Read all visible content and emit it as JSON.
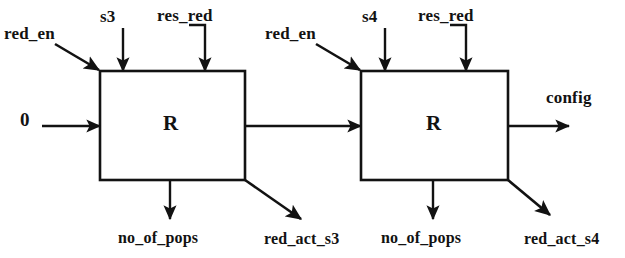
{
  "diagram": {
    "line_color": "#121212",
    "background_color": "#ffffff",
    "blocks": [
      {
        "id": "block-r-1",
        "label": "R",
        "x": 100,
        "y": 71,
        "width": 145,
        "height": 109
      },
      {
        "id": "block-r-2",
        "label": "R",
        "x": 361,
        "y": 71,
        "width": 147,
        "height": 109
      }
    ],
    "labels": {
      "block1": {
        "red_en": "red_en",
        "s3": "s3",
        "res_red": "res_red",
        "input_zero": "0",
        "no_of_pops": "no_of_pops",
        "red_act": "red_act_s3"
      },
      "block2": {
        "red_en": "red_en",
        "s4": "s4",
        "res_red": "res_red",
        "no_of_pops": "no_of_pops",
        "red_act": "red_act_s4",
        "config": "config"
      }
    },
    "signals": [
      {
        "name": "red_en",
        "direction": "in",
        "target": "block-r-1",
        "edge": "top-left-corner",
        "style": "diagonal"
      },
      {
        "name": "s3",
        "direction": "in",
        "target": "block-r-1",
        "edge": "top",
        "style": "vertical"
      },
      {
        "name": "res_red",
        "direction": "in",
        "target": "block-r-1",
        "edge": "top",
        "style": "elbow"
      },
      {
        "name": "0",
        "direction": "in",
        "target": "block-r-1",
        "edge": "left",
        "style": "horizontal"
      },
      {
        "name": "no_of_pops",
        "direction": "out",
        "target": "block-r-1",
        "edge": "bottom",
        "style": "vertical"
      },
      {
        "name": "red_act_s3",
        "direction": "out",
        "target": "block-r-1",
        "edge": "bottom-right-corner",
        "style": "diagonal"
      },
      {
        "name": "chain",
        "direction": "out",
        "target": "block-r-2",
        "edge": "right",
        "style": "horizontal"
      },
      {
        "name": "red_en",
        "direction": "in",
        "target": "block-r-2",
        "edge": "top-left-corner",
        "style": "diagonal"
      },
      {
        "name": "s4",
        "direction": "in",
        "target": "block-r-2",
        "edge": "top",
        "style": "vertical"
      },
      {
        "name": "res_red",
        "direction": "in",
        "target": "block-r-2",
        "edge": "top",
        "style": "elbow"
      },
      {
        "name": "no_of_pops",
        "direction": "out",
        "target": "block-r-2",
        "edge": "bottom",
        "style": "vertical"
      },
      {
        "name": "red_act_s4",
        "direction": "out",
        "target": "block-r-2",
        "edge": "bottom-right-corner",
        "style": "diagonal"
      },
      {
        "name": "config",
        "direction": "out",
        "target": "block-r-2",
        "edge": "right",
        "style": "horizontal"
      }
    ]
  }
}
